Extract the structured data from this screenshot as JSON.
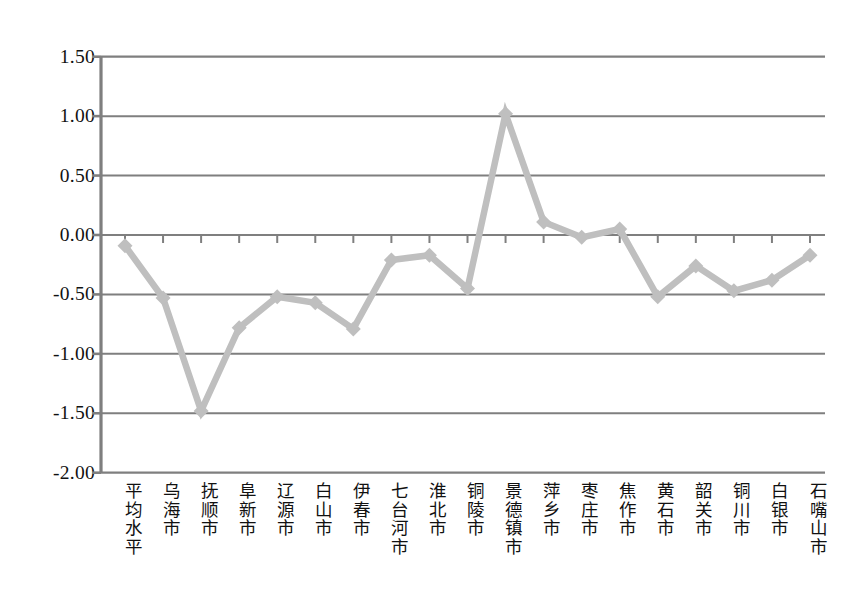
{
  "chart_data": {
    "type": "line",
    "title": "",
    "xlabel": "",
    "ylabel": "",
    "ylim": [
      -2.0,
      1.5
    ],
    "ytick_labels": [
      "1.50",
      "1.00",
      "0.50",
      "0.00",
      "-0.50",
      "-1.00",
      "-1.50",
      "-2.00"
    ],
    "ytick_values": [
      1.5,
      1.0,
      0.5,
      0.0,
      -0.5,
      -1.0,
      -1.5,
      -2.0
    ],
    "grid": true,
    "legend": "none",
    "marker": "diamond",
    "line_color": "#bfbfbf",
    "marker_color": "#bfbfbf",
    "grid_color": "#7f7f7f",
    "axis_color": "#7f7f7f",
    "categories": [
      "平均水平",
      "乌海市",
      "抚顺市",
      "阜新市",
      "辽源市",
      "白山市",
      "伊春市",
      "七台河市",
      "淮北市",
      "铜陵市",
      "景德镇市",
      "萍乡市",
      "枣庄市",
      "焦作市",
      "黄石市",
      "韶关市",
      "铜川市",
      "白银市",
      "石嘴山市"
    ],
    "values": [
      -0.09,
      -0.53,
      -1.48,
      -0.78,
      -0.52,
      -0.57,
      -0.79,
      -0.21,
      -0.17,
      -0.45,
      1.02,
      0.11,
      -0.02,
      0.05,
      -0.52,
      -0.26,
      -0.47,
      -0.38,
      -0.17
    ]
  }
}
